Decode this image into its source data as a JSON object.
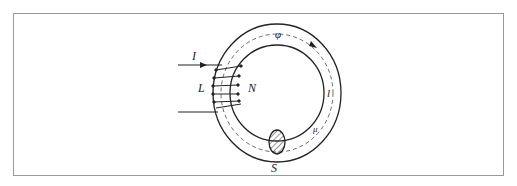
{
  "diagram": {
    "labels": {
      "current": "I",
      "inductance": "L",
      "turns": "N",
      "flux": "φ",
      "length": "l",
      "permeability": "μ",
      "cross_section": "S"
    },
    "colors": {
      "stroke": "#222222",
      "frame": "#999999"
    }
  }
}
